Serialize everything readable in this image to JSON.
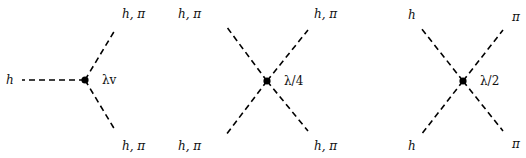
{
  "diagrams": [
    {
      "id": "trilinear",
      "vertex": {
        "x": 85,
        "y": 80
      },
      "coupling": "λv",
      "coupling_pos": {
        "x": 102,
        "y": 84
      },
      "legs": [
        {
          "x2": 22,
          "y2": 80,
          "label": "h",
          "lx": 6,
          "ly": 84
        },
        {
          "x2": 115,
          "y2": 30,
          "label": "h, π",
          "lx": 122,
          "ly": 18
        },
        {
          "x2": 115,
          "y2": 130,
          "label": "h, π",
          "lx": 122,
          "ly": 150
        }
      ]
    },
    {
      "id": "quartic-all",
      "vertex": {
        "x": 267,
        "y": 81
      },
      "coupling": "λ/4",
      "coupling_pos": {
        "x": 284,
        "y": 85
      },
      "legs": [
        {
          "x2": 226,
          "y2": 26,
          "label": "h, π",
          "lx": 178,
          "ly": 18
        },
        {
          "x2": 308,
          "y2": 30,
          "label": "h, π",
          "lx": 314,
          "ly": 18
        },
        {
          "x2": 226,
          "y2": 135,
          "label": "h, π",
          "lx": 178,
          "ly": 150
        },
        {
          "x2": 308,
          "y2": 131,
          "label": "h, π",
          "lx": 314,
          "ly": 150
        }
      ]
    },
    {
      "id": "quartic-mixed",
      "vertex": {
        "x": 463,
        "y": 81
      },
      "coupling": "λ/2",
      "coupling_pos": {
        "x": 480,
        "y": 85
      },
      "legs": [
        {
          "x2": 421,
          "y2": 28,
          "label": "h",
          "lx": 408,
          "ly": 19
        },
        {
          "x2": 503,
          "y2": 30,
          "label": "π",
          "lx": 512,
          "ly": 21
        },
        {
          "x2": 421,
          "y2": 135,
          "label": "h",
          "lx": 408,
          "ly": 150
        },
        {
          "x2": 503,
          "y2": 131,
          "label": "π",
          "lx": 512,
          "ly": 148
        }
      ]
    }
  ]
}
